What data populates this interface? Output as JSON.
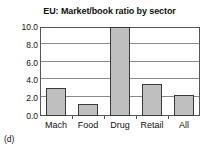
{
  "figure": {
    "panel_caption": "(d)",
    "background_color": "#ffffff"
  },
  "chart_data": {
    "type": "bar",
    "title": "EU: Market/book ratio by sector",
    "xlabel": "",
    "ylabel": "",
    "categories": [
      "Mach",
      "Food",
      "Drug",
      "Retail",
      "All"
    ],
    "values": [
      3.15,
      1.35,
      10.0,
      3.6,
      2.35
    ],
    "ylim": [
      0.0,
      10.0
    ],
    "ytick_values": [
      0.0,
      2.0,
      4.0,
      6.0,
      8.0,
      10.0
    ],
    "ytick_labels": [
      "0.0",
      "2.0",
      "4.0",
      "6.0",
      "8.0",
      "10.0"
    ],
    "grid": true,
    "grid_orientation": "horizontal",
    "legend": false,
    "legend_position": "none",
    "bar_fill_color": "#bfbfbf",
    "bar_edge_color": "#3a3a3a",
    "grid_color": "#8a8a8a",
    "axis_color": "#555555"
  }
}
